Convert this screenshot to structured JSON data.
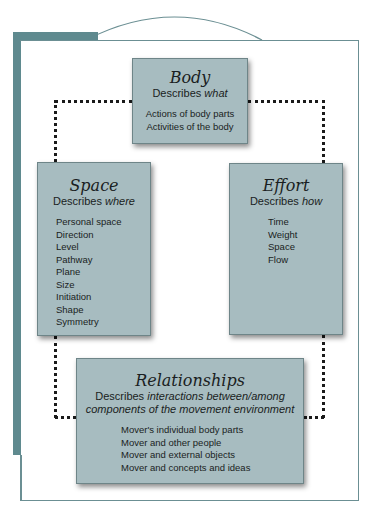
{
  "colors": {
    "frame_teal": "#5f8a8f",
    "box_fill": "#a7bcc0",
    "dotted_line": "#1a1a1a"
  },
  "body": {
    "title": "Body",
    "describes": "Describes",
    "describes_emph": "what",
    "items": [
      "Actions of body parts",
      "Activities of the body"
    ]
  },
  "space": {
    "title": "Space",
    "describes": "Describes",
    "describes_emph": "where",
    "items": [
      "Personal space",
      "Direction",
      "Level",
      "Pathway",
      "Plane",
      "Size",
      "Initiation",
      "Shape",
      "Symmetry"
    ]
  },
  "effort": {
    "title": "Effort",
    "describes": "Describes",
    "describes_emph": "how",
    "items": [
      "Time",
      "Weight",
      "Space",
      "Flow"
    ]
  },
  "relationships": {
    "title": "Relationships",
    "describes": "Describes",
    "describes_emph_line1": "interactions between/among",
    "describes_emph_line2": "components of the movement environment",
    "items": [
      "Mover's individual body parts",
      "Mover and other people",
      "Mover and external objects",
      "Mover and concepts and ideas"
    ]
  }
}
